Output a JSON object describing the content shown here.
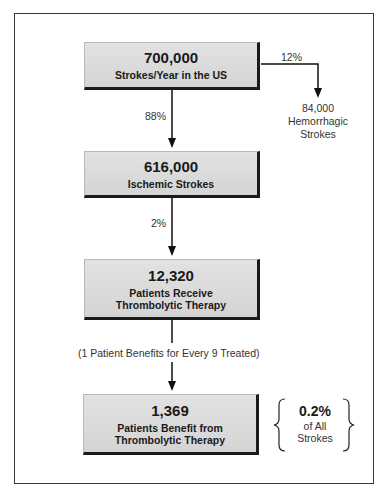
{
  "boxes": [
    {
      "value": "700,000",
      "label_lines": [
        "Strokes/Year in the US"
      ]
    },
    {
      "value": "616,000",
      "label_lines": [
        "Ischemic Strokes"
      ]
    },
    {
      "value": "12,320",
      "label_lines": [
        "Patients Receive",
        "Thrombolytic Therapy"
      ]
    },
    {
      "value": "1,369",
      "label_lines": [
        "Patients Benefit from",
        "Thrombolytic Therapy"
      ]
    }
  ],
  "edges": {
    "to_ischemic_pct": "88%",
    "to_hemorrhagic_pct": "12%",
    "to_treated_pct": "2%",
    "benefit_note": "(1 Patient Benefits for Every 9 Treated)"
  },
  "hemorrhagic": {
    "value": "84,000",
    "label_lines": [
      "Hemorrhagic",
      "Strokes"
    ]
  },
  "summary": {
    "value": "0.2%",
    "label_lines": [
      "of All",
      "Strokes"
    ]
  }
}
